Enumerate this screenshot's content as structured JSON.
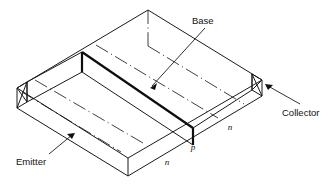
{
  "figure": {
    "title_alt": "Isometric cutaway of an n-p-n junction transistor slab",
    "labels": {
      "base": "Base",
      "collector": "Collector",
      "emitter": "Emitter"
    },
    "region_labels": {
      "emitter_region": "n",
      "base_region": "p",
      "collector_region": "n"
    },
    "leaders": [
      {
        "name": "base-leader",
        "from": "Base label",
        "to": "base p-layer top edge"
      },
      {
        "name": "collector-leader",
        "from": "Collector label",
        "to": "right end face"
      },
      {
        "name": "emitter-leader",
        "from": "Emitter label",
        "to": "front-left bottom edge"
      }
    ],
    "colors": {
      "stroke": "#1a1a1a",
      "stroke_emphasis": "#0d0d0d",
      "background": "#ffffff"
    }
  }
}
